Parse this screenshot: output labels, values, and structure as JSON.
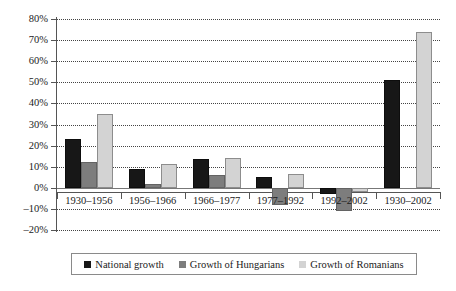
{
  "chart_data": {
    "type": "bar",
    "title": "",
    "xlabel": "",
    "ylabel": "",
    "categories": [
      "1930–1956",
      "1956–1966",
      "1966–1977",
      "1977–1992",
      "1992–2002",
      "1930–2002"
    ],
    "series": [
      {
        "name": "National growth",
        "color": "#171717",
        "values": [
          23,
          9,
          13.5,
          5,
          -3,
          51
        ]
      },
      {
        "name": "Growth of Hungarians",
        "color": "#7d7d7d",
        "values": [
          12,
          2,
          6,
          -8,
          -11,
          0
        ]
      },
      {
        "name": "Growth of Romanians",
        "color": "#d3d3d3",
        "values": [
          35,
          11.5,
          14,
          6.5,
          -2,
          74
        ]
      }
    ],
    "ylim": [
      -20,
      80
    ],
    "ytick_step": 10,
    "ytick_labels": [
      "80%",
      "70%",
      "60%",
      "50%",
      "40%",
      "30%",
      "20%",
      "10%",
      "0%",
      "–10%",
      "–20%"
    ],
    "ytick_values": [
      80,
      70,
      60,
      50,
      40,
      30,
      20,
      10,
      0,
      -10,
      -20
    ],
    "grid": true,
    "grid_style": "dotted-horizontal",
    "legend_position": "bottom"
  },
  "legend": {
    "items": [
      {
        "label": "National growth"
      },
      {
        "label": "Growth of Hungarians"
      },
      {
        "label": "Growth of Romanians"
      }
    ]
  }
}
